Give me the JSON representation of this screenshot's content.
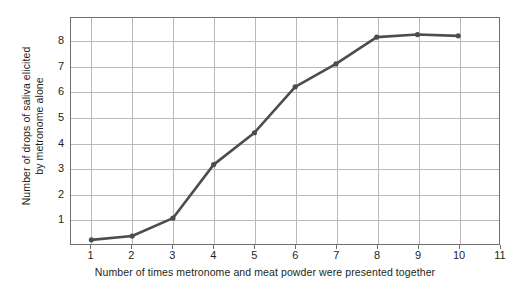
{
  "chart_data": {
    "type": "line",
    "title": "",
    "xlabel": "Number of times metronome and meat powder were presented together",
    "ylabel_line1": "Number of drops of saliva elicited",
    "ylabel_line2": "by metronome alone",
    "x": [
      1,
      2,
      3,
      4,
      5,
      6,
      7,
      8,
      9,
      10
    ],
    "values": [
      0.2,
      0.35,
      1.05,
      3.15,
      4.4,
      6.2,
      7.1,
      8.15,
      8.25,
      8.2
    ],
    "series": [
      {
        "name": "Drops of saliva",
        "values": [
          0.2,
          0.35,
          1.05,
          3.15,
          4.4,
          6.2,
          7.1,
          8.15,
          8.25,
          8.2
        ]
      }
    ],
    "xlim": [
      0.5,
      11
    ],
    "ylim": [
      0,
      8.9
    ],
    "xticks": [
      1,
      2,
      3,
      4,
      5,
      6,
      7,
      8,
      9,
      10,
      11
    ],
    "xtick_labels": [
      "1",
      "2",
      "3",
      "4",
      "5",
      "6",
      "7",
      "8",
      "9",
      "10",
      "11"
    ],
    "yticks": [
      1,
      2,
      3,
      4,
      5,
      6,
      7,
      8
    ],
    "ytick_labels": [
      "1",
      "2",
      "3",
      "4",
      "5",
      "6",
      "7",
      "8"
    ],
    "grid": true,
    "legend": false,
    "line_color": "#4d4d4d",
    "marker_color": "#4d4d4d",
    "grid_color": "#b9b9b9",
    "axis_color": "#6e6e6e",
    "text_color": "#231f20",
    "background": "#ffffff"
  }
}
